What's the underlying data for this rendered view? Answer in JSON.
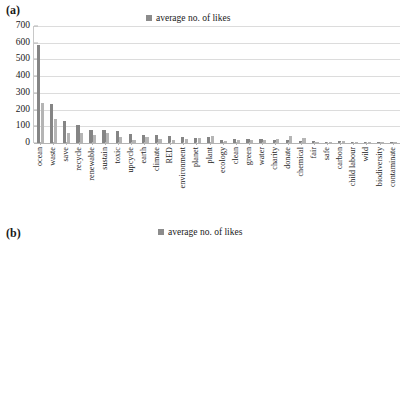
{
  "panels": [
    {
      "label": "(a)",
      "legend_label": "average no. of likes"
    },
    {
      "label": "(b)",
      "legend_label": "average no. of likes"
    }
  ],
  "legend": {
    "marker_color": "#8c8c8c"
  },
  "colors": {
    "series1": "#858585",
    "series2": "#b5b5b5",
    "grid": "#dcdcdc",
    "axis": "#b4b4b4"
  },
  "chart_data": [
    {
      "type": "bar",
      "title": "(a)",
      "xlabel": "",
      "ylabel": "",
      "ylim": [
        0,
        700
      ],
      "yticks": [
        0,
        100,
        200,
        300,
        400,
        500,
        600,
        700
      ],
      "grid": true,
      "legend_position": "top-center",
      "legend_entries": [
        "average no. of likes"
      ],
      "categories": [
        "ocean",
        "waste",
        "save",
        "recycle",
        "renewable",
        "sustain",
        "toxic",
        "upcycle",
        "earth",
        "climate",
        "RED",
        "environment",
        "planet",
        "plant",
        "ecology",
        "clean",
        "green",
        "water",
        "charity",
        "donate",
        "chemical",
        "fair",
        "safe",
        "carbon",
        "child labour",
        "wild",
        "biodiversity",
        "contaminate"
      ],
      "series": [
        {
          "name": "average no. of likes (dark)",
          "values": [
            585,
            232,
            130,
            110,
            78,
            76,
            74,
            55,
            45,
            46,
            43,
            33,
            32,
            38,
            16,
            24,
            26,
            24,
            20,
            19,
            14,
            11,
            8,
            10,
            7,
            5,
            3,
            2
          ]
        },
        {
          "name": "average no. of likes (light)",
          "values": [
            240,
            143,
            58,
            60,
            48,
            57,
            36,
            18,
            38,
            22,
            18,
            26,
            28,
            41,
            10,
            19,
            18,
            16,
            26,
            40,
            28,
            8,
            6,
            12,
            5,
            4,
            2,
            1
          ]
        }
      ]
    },
    {
      "type": "bar",
      "title": "(b)",
      "xlabel": "",
      "ylabel": "",
      "ylim": [
        0,
        500
      ],
      "yticks": [
        0,
        100,
        200,
        300,
        400,
        500
      ],
      "grid": true,
      "legend_position": "top-center",
      "legend_entries": [
        "average no. of likes"
      ],
      "categories": [
        "donate",
        "earth",
        "water",
        "climate",
        "fair",
        "sustain",
        "green",
        "CSR",
        "environment",
        "charity",
        "safe",
        "ocean",
        "save",
        "RED",
        "upcycle"
      ],
      "series": [
        {
          "name": "average no. of likes (dark)",
          "values": [
            405,
            393,
            248,
            233,
            85,
            48,
            48,
            40,
            25,
            28,
            22,
            25,
            22,
            2,
            2
          ]
        },
        {
          "name": "average no. of likes (light)",
          "values": [
            215,
            233,
            178,
            80,
            70,
            22,
            45,
            15,
            12,
            15,
            12,
            25,
            8,
            1,
            10
          ]
        }
      ]
    }
  ]
}
